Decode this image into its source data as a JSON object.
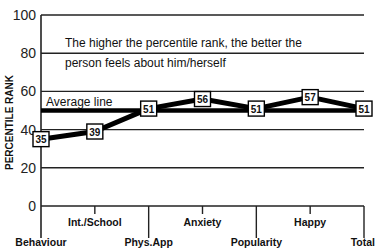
{
  "chart_data": {
    "type": "line",
    "title": "",
    "xlabel": "",
    "ylabel": "PERCENTILE RANK",
    "ylim": [
      0,
      100
    ],
    "yticks": [
      0,
      20,
      40,
      60,
      80,
      100
    ],
    "grid": true,
    "categories": [
      "Behaviour",
      "Int./School",
      "Phys.App",
      "Anxiety",
      "Popularity",
      "Happy",
      "Total"
    ],
    "series": [
      {
        "name": "Percentile rank",
        "values": [
          35,
          39,
          51,
          56,
          51,
          57,
          51
        ]
      }
    ],
    "reference_lines": [
      {
        "name": "Average line",
        "value": 50
      }
    ],
    "annotations": [
      "The higher the percentile rank, the better the",
      "person feels about him/herself",
      "Average line"
    ]
  },
  "text": {
    "annotation_line1": "The higher the percentile rank, the better the",
    "annotation_line2": "person feels about him/herself",
    "average_label": "Average line",
    "ylabel": "PERCENTILE RANK"
  }
}
